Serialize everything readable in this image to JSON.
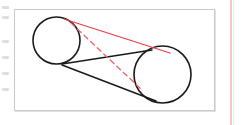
{
  "page": {
    "background_color": "#ffffff",
    "left_margin_marks": [
      {
        "top": 6
      },
      {
        "top": 16
      },
      {
        "top": 40
      },
      {
        "top": 56
      },
      {
        "top": 72
      },
      {
        "top": 88
      }
    ],
    "right_rule": {
      "name": "vertical-pink-rule",
      "color": "#f3c8cd",
      "x": 230,
      "width": 2
    }
  },
  "figure": {
    "name": "two-circles-tangent-lines-diagram",
    "frame": {
      "x": 14,
      "y": 9,
      "width": 201,
      "height": 102,
      "border_color": "#c9c9cd",
      "fill_color": "#ffffff"
    },
    "colors": {
      "stroke_black": "#1a1a1a",
      "stroke_red": "#e8414a",
      "stroke_red_dashed": "#ea6a72"
    },
    "circles": [
      {
        "name": "left-circle",
        "cx": 56.5,
        "cy": 40.5,
        "r": 23.5,
        "stroke": "#1a1a1a",
        "stroke_width": 1.6,
        "fill": "none"
      },
      {
        "name": "right-circle",
        "cx": 162.5,
        "cy": 74.5,
        "r": 28.5,
        "stroke": "#1a1a1a",
        "stroke_width": 1.6,
        "fill": "none"
      }
    ],
    "lines": [
      {
        "name": "black-internal-tangent-upper",
        "x1": 62,
        "y1": 64,
        "x2": 152,
        "y2": 50,
        "stroke": "#1a1a1a",
        "stroke_width": 1.5,
        "dashed": false
      },
      {
        "name": "black-internal-tangent-lower",
        "x1": 62,
        "y1": 65,
        "x2": 156,
        "y2": 101,
        "stroke": "#1a1a1a",
        "stroke_width": 1.5,
        "dashed": false
      },
      {
        "name": "red-external-tangent",
        "x1": 64,
        "y1": 19,
        "x2": 170,
        "y2": 53,
        "stroke": "#e8414a",
        "stroke_width": 1.3,
        "dashed": false
      },
      {
        "name": "red-dashed-chord",
        "x1": 71,
        "y1": 23,
        "x2": 142,
        "y2": 90,
        "stroke": "#ea6a72",
        "stroke_width": 1.4,
        "dashed": true,
        "dash_pattern": "5 4"
      }
    ]
  }
}
